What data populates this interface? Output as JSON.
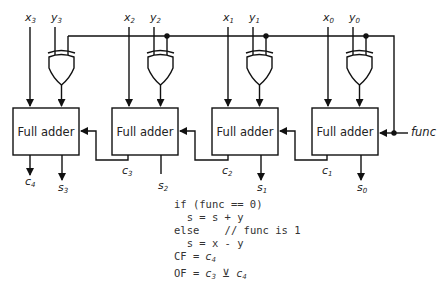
{
  "diagram": {
    "full_adder_label": "Full adder",
    "inputs": {
      "x": [
        {
          "name": "x",
          "sub": "3"
        },
        {
          "name": "x",
          "sub": "2"
        },
        {
          "name": "x",
          "sub": "1"
        },
        {
          "name": "x",
          "sub": "0"
        }
      ],
      "y": [
        {
          "name": "y",
          "sub": "3"
        },
        {
          "name": "y",
          "sub": "2"
        },
        {
          "name": "y",
          "sub": "1"
        },
        {
          "name": "y",
          "sub": "0"
        }
      ],
      "control": "func"
    },
    "outputs": {
      "sums": [
        {
          "name": "s",
          "sub": "3"
        },
        {
          "name": "s",
          "sub": "2"
        },
        {
          "name": "s",
          "sub": "1"
        },
        {
          "name": "s",
          "sub": "0"
        }
      ],
      "carries": [
        {
          "name": "c",
          "sub": "4"
        },
        {
          "name": "c",
          "sub": "3"
        },
        {
          "name": "c",
          "sub": "2"
        },
        {
          "name": "c",
          "sub": "1"
        }
      ]
    },
    "gates": [
      "XOR",
      "XOR",
      "XOR",
      "XOR"
    ],
    "code": {
      "line1": "if (func == 0)",
      "line2": "  s = s + y",
      "line3_kw": "else",
      "line3_comment": "// func is 1",
      "line4": "  s = x - y",
      "line5_prefix": "CF = ",
      "line5_var": "c",
      "line5_sub": "4",
      "line6_prefix": "OF = ",
      "line6_var1": "c",
      "line6_sub1": "3",
      "line6_op": "⊻",
      "line6_var2": "c",
      "line6_sub2": "4"
    }
  }
}
